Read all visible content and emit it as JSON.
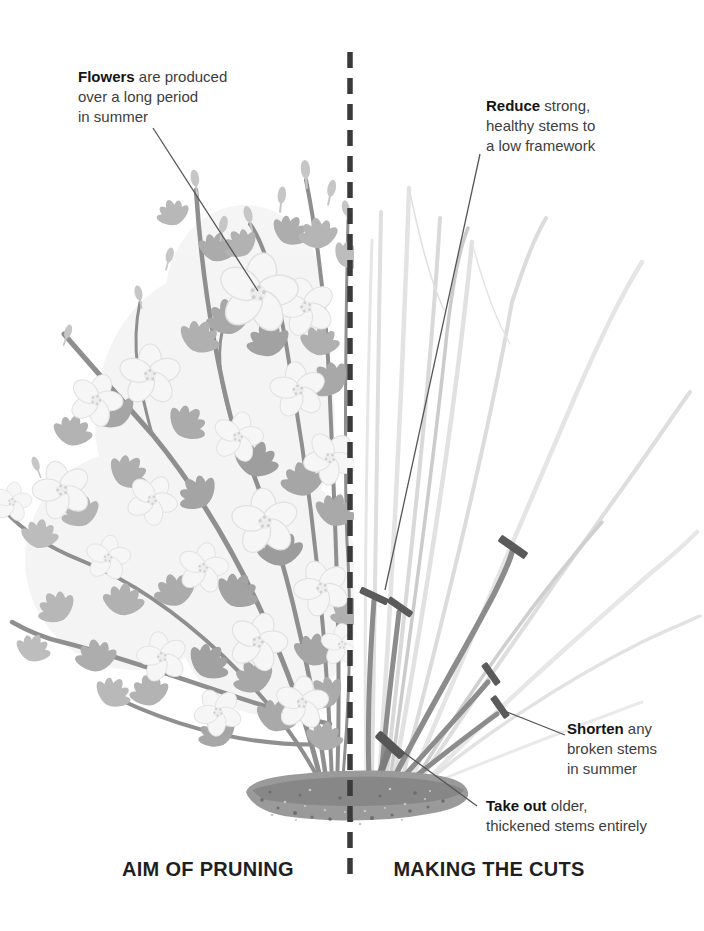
{
  "sections": {
    "left_label": "AIM OF PRUNING",
    "right_label": "MAKING THE CUTS"
  },
  "annotations": {
    "flowers": {
      "lead": "Flowers",
      "lead_suffix": "are produced",
      "lines": [
        "over a long period",
        "in summer"
      ]
    },
    "reduce": {
      "lead": "Reduce",
      "lead_suffix": "strong,",
      "lines": [
        "healthy stems to",
        "a low framework"
      ]
    },
    "shorten": {
      "lead": "Shorten",
      "lead_suffix": "any",
      "lines": [
        "broken stems",
        "in summer"
      ]
    },
    "take_out": {
      "lead": "Take out",
      "lead_suffix": "older,",
      "lines": [
        "thickened stems entirely"
      ]
    }
  },
  "illustration": {
    "cut_mark_count": 6,
    "divider_style": "vertical dashed line"
  },
  "colors": {
    "background": "#ffffff",
    "annotation_text": "#3d3d3d",
    "annotation_lead": "#151515",
    "section_label": "#1f1f1f",
    "divider": "#3a3a3a",
    "leader_line": "#555555",
    "cut_mark": "#5a5a5a",
    "framework_stem": "#8c8c8c",
    "ghost_stem": "#dfdfdf",
    "leaf": "#ababab",
    "flower_petal": "#f6f6f6",
    "soil": "#9a9a9a"
  }
}
